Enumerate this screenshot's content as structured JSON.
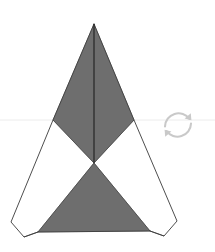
{
  "canvas": {
    "width": 215,
    "height": 252,
    "background_color": "#ffffff",
    "title": "Folded paper net"
  },
  "palette": {
    "shaded_face_fill": "#6e6e6e",
    "unshaded_face_fill": "#ffffff",
    "outline_stroke": "#3a3a3a",
    "crease_stroke": "#2b2b2b",
    "horizon_line": "#ececec",
    "watermark_stroke": "#c9c9c9"
  },
  "guides": {
    "horizon_line": {
      "name": "horizon-line",
      "y": 120,
      "x_start": 0,
      "x_end": 215,
      "color": "#ececec"
    }
  },
  "geometry": {
    "apex": {
      "x": 94,
      "y": 24
    },
    "center_pinch": {
      "x": 94,
      "y": 163
    },
    "left_wing_vertex": {
      "x": 53,
      "y": 120
    },
    "right_wing_vertex": {
      "x": 134,
      "y": 120
    },
    "bottom_left_tip": {
      "x": 38,
      "y": 232
    },
    "bottom_right_tip": {
      "x": 150,
      "y": 231
    },
    "outer_left_corner": {
      "x": 24,
      "y": 237
    },
    "outer_right_corner": {
      "x": 164,
      "y": 236
    },
    "flap_left_outer": {
      "x": 11,
      "y": 222
    },
    "flap_right_outer": {
      "x": 177,
      "y": 221
    }
  },
  "shapes": [
    {
      "name": "shaded-face-upper-left",
      "role": "shaded-face",
      "fill": "#6e6e6e",
      "points": "94,24 53,120 94,163"
    },
    {
      "name": "shaded-face-upper-right",
      "role": "shaded-face",
      "fill": "#6e6e6e",
      "points": "94,24 134,120 94,163"
    },
    {
      "name": "unshaded-face-lower-left",
      "role": "unshaded-face",
      "fill": "#ffffff",
      "points": "53,120 94,163 38,232 24,237 11,222"
    },
    {
      "name": "unshaded-face-lower-right",
      "role": "unshaded-face",
      "fill": "#ffffff",
      "points": "134,120 94,163 150,231 164,236 177,221"
    },
    {
      "name": "shaded-face-bottom",
      "role": "shaded-face",
      "fill": "#6e6e6e",
      "points": "94,163 150,231 38,232"
    }
  ],
  "outlines": [
    {
      "name": "outline-left-edge",
      "points": "94,24 53,120 11,222 24,237 38,232"
    },
    {
      "name": "outline-right-edge",
      "points": "94,24 134,120 177,221 164,236 150,231"
    },
    {
      "name": "outline-bottom-edge",
      "points": "38,232 150,231"
    }
  ],
  "creases": [
    {
      "name": "crease-vertical-seam",
      "x1": 94,
      "y1": 24,
      "x2": 94,
      "y2": 163
    },
    {
      "name": "crease-left-wing",
      "x1": 53,
      "y1": 120,
      "x2": 94,
      "y2": 163
    },
    {
      "name": "crease-right-wing",
      "x1": 134,
      "y1": 120,
      "x2": 94,
      "y2": 163
    },
    {
      "name": "crease-bottom-left",
      "x1": 94,
      "y1": 163,
      "x2": 38,
      "y2": 232
    },
    {
      "name": "crease-bottom-right",
      "x1": 94,
      "y1": 163,
      "x2": 150,
      "y2": 231
    },
    {
      "name": "crease-flap-left",
      "x1": 24,
      "y1": 237,
      "x2": 38,
      "y2": 232
    },
    {
      "name": "crease-flap-right",
      "x1": 164,
      "y1": 236,
      "x2": 150,
      "y2": 231
    }
  ],
  "watermark": {
    "name": "rotate-icon",
    "label": "rotate",
    "color": "#c9c9c9",
    "center": {
      "x": 178,
      "y": 125
    },
    "radius": 16
  }
}
